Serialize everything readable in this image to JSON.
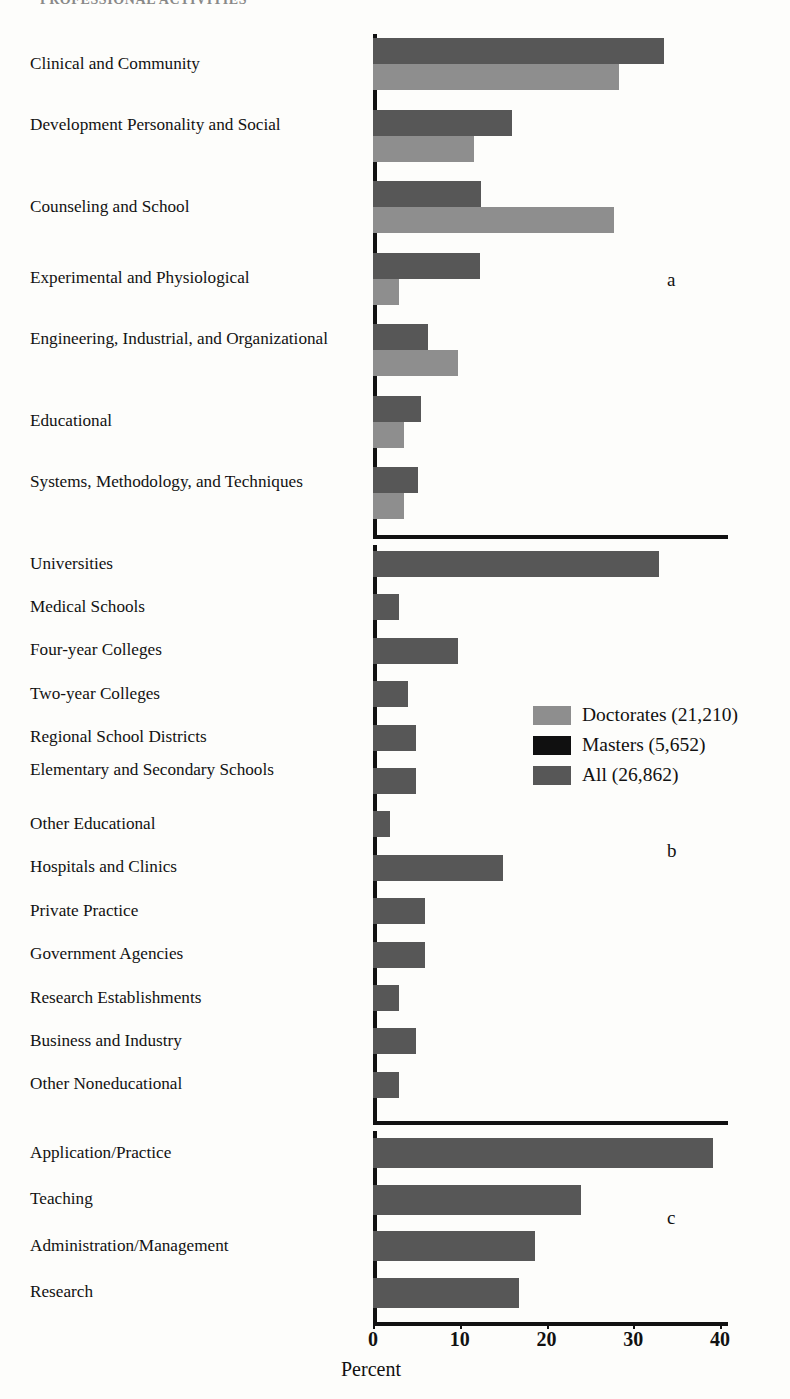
{
  "figure": {
    "cutoff_title": "PROFESSIONAL ACTIVITIES",
    "x_axis_title": "Percent",
    "panel_marks": {
      "a": "a",
      "b": "b",
      "c": "c"
    }
  },
  "legend": {
    "position": "middle-right",
    "entries": [
      {
        "label": "Doctorates (21,210)",
        "key": "doc",
        "color": "#8e8e8e"
      },
      {
        "label": "Masters (5,652)",
        "key": "mas",
        "color": "#101010"
      },
      {
        "label": "All (26,862)",
        "key": "all",
        "color": "#575757"
      }
    ]
  },
  "axis": {
    "ticks": [
      "0",
      "10",
      "20",
      "30",
      "40"
    ],
    "min": 0,
    "max": 40
  },
  "chart_data": [
    {
      "type": "bar",
      "panel": "a",
      "title": "Major Field / Subfield of Psychology",
      "orientation": "horizontal",
      "xlabel": "Percent",
      "ylabel": "",
      "xlim": [
        0,
        40
      ],
      "grid": false,
      "categories": [
        "Clinical and Community",
        "Development Personality and Social",
        "Counseling and School",
        "Experimental and Physiological",
        "Engineering, Industrial, and Organizational",
        "Educational",
        "Systems, Methodology, and Techniques"
      ],
      "series": [
        {
          "name": "All (26,862)",
          "key": "all",
          "color": "#575757",
          "values": [
            33.5,
            16.0,
            12.5,
            12.3,
            6.3,
            5.5,
            5.2
          ]
        },
        {
          "name": "Doctorates (21,210)",
          "key": "doc",
          "color": "#8e8e8e",
          "values": [
            28.4,
            11.6,
            27.8,
            3.0,
            9.8,
            3.6,
            3.6
          ]
        }
      ]
    },
    {
      "type": "bar",
      "panel": "b",
      "title": "Employment Setting",
      "orientation": "horizontal",
      "xlabel": "Percent",
      "ylabel": "",
      "xlim": [
        0,
        40
      ],
      "grid": false,
      "categories": [
        "Universities",
        "Medical Schools",
        "Four-year Colleges",
        "Two-year Colleges",
        "Regional School Districts",
        "Elementary and Secondary Schools",
        "Other Educational",
        "Hospitals and Clinics",
        "Private Practice",
        "Government Agencies",
        "Research Establishments",
        "Business and Industry",
        "Other Noneducational"
      ],
      "series": [
        {
          "name": "All (26,862)",
          "key": "all",
          "color": "#575757",
          "values": [
            33.0,
            3.0,
            9.8,
            4.0,
            5.0,
            5.0,
            2.0,
            15.0,
            6.0,
            6.0,
            3.0,
            5.0,
            3.0
          ]
        }
      ]
    },
    {
      "type": "bar",
      "panel": "c",
      "title": "Primary Work Activity",
      "orientation": "horizontal",
      "xlabel": "Percent",
      "ylabel": "",
      "xlim": [
        0,
        40
      ],
      "grid": false,
      "categories": [
        "Application/Practice",
        "Teaching",
        "Administration/Management",
        "Research"
      ],
      "series": [
        {
          "name": "All (26,862)",
          "key": "all",
          "color": "#575757",
          "values": [
            39.2,
            24.0,
            18.7,
            16.8
          ]
        }
      ]
    }
  ]
}
